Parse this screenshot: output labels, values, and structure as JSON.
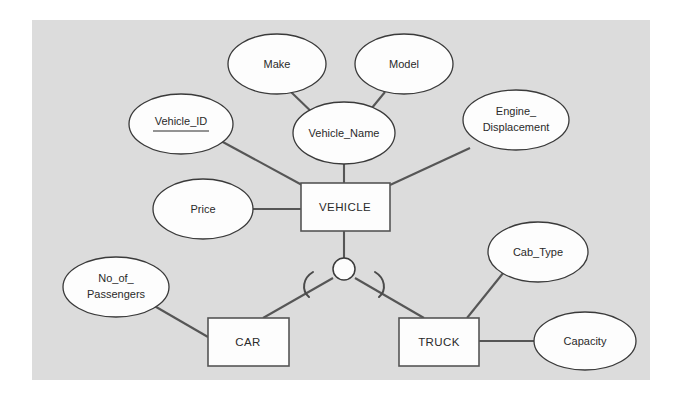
{
  "diagram": {
    "background_color": "#dcdcdc",
    "page_color": "#ffffff",
    "shape_fill": "#fdfdfd",
    "line_color": "#565656",
    "text_color": "#2a2a2a",
    "entities": [
      {
        "id": "vehicle",
        "label": "VEHICLE",
        "type": "superclass"
      },
      {
        "id": "car",
        "label": "CAR",
        "type": "subclass"
      },
      {
        "id": "truck",
        "label": "TRUCK",
        "type": "subclass"
      }
    ],
    "attributes": [
      {
        "id": "vehicle_id",
        "label": "Vehicle_ID",
        "primary_key": true,
        "owner": "vehicle",
        "lines": [
          "Vehicle_ID"
        ]
      },
      {
        "id": "make",
        "label": "Make",
        "primary_key": false,
        "owner": "vehicle_name",
        "lines": [
          "Make"
        ]
      },
      {
        "id": "model",
        "label": "Model",
        "primary_key": false,
        "owner": "vehicle_name",
        "lines": [
          "Model"
        ]
      },
      {
        "id": "vehicle_name",
        "label": "Vehicle_Name",
        "primary_key": false,
        "owner": "vehicle",
        "lines": [
          "Vehicle_Name"
        ]
      },
      {
        "id": "engine_displacement",
        "label": "Engine_Displacement",
        "primary_key": false,
        "owner": "vehicle",
        "lines": [
          "Engine_",
          "Displacement"
        ]
      },
      {
        "id": "price",
        "label": "Price",
        "primary_key": false,
        "owner": "vehicle",
        "lines": [
          "Price"
        ]
      },
      {
        "id": "no_of_passengers",
        "label": "No_of_Passengers",
        "primary_key": false,
        "owner": "car",
        "lines": [
          "No_of_",
          "Passengers"
        ]
      },
      {
        "id": "cab_type",
        "label": "Cab_Type",
        "primary_key": false,
        "owner": "truck",
        "lines": [
          "Cab_Type"
        ]
      },
      {
        "id": "capacity",
        "label": "Capacity",
        "primary_key": false,
        "owner": "truck",
        "lines": [
          "Capacity"
        ]
      }
    ],
    "specialization": {
      "id": "specialization-circle",
      "label": "",
      "notation": "subset",
      "superclass": "vehicle",
      "subclasses": [
        "car",
        "truck"
      ]
    }
  }
}
